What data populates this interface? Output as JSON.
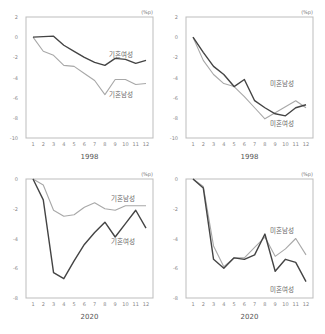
{
  "chart_data": [
    {
      "type": "line",
      "title": "",
      "xlabel": "1998",
      "ylabel": "",
      "unit": "(%p)",
      "categories": [
        "1",
        "2",
        "3",
        "4",
        "5",
        "6",
        "7",
        "8",
        "9",
        "10",
        "11",
        "12"
      ],
      "yticks": [
        2,
        0,
        -2,
        -4,
        -6,
        -8,
        -10
      ],
      "ylim": [
        -10,
        2
      ],
      "series": [
        {
          "name": "기혼여성",
          "color": "#444444",
          "values": [
            0,
            0.05,
            0.1,
            -0.8,
            -1.4,
            -2.0,
            -2.5,
            -2.8,
            -2.1,
            -2.2,
            -2.6,
            -2.3
          ]
        },
        {
          "name": "기혼남성",
          "color": "#a8a8a8",
          "values": [
            0,
            -1.4,
            -1.8,
            -2.8,
            -2.9,
            -3.6,
            -4.3,
            -5.7,
            -4.2,
            -4.2,
            -4.7,
            -4.6
          ]
        }
      ]
    },
    {
      "type": "line",
      "title": "",
      "xlabel": "1998",
      "ylabel": "",
      "unit": "(%p)",
      "categories": [
        "1",
        "2",
        "3",
        "4",
        "5",
        "6",
        "7",
        "8",
        "9",
        "10",
        "11",
        "12"
      ],
      "yticks": [
        2,
        0,
        -2,
        -4,
        -6,
        -8,
        -10
      ],
      "ylim": [
        -10,
        2
      ],
      "series": [
        {
          "name": "미혼남성",
          "color": "#444444",
          "values": [
            0,
            -1.5,
            -2.9,
            -3.7,
            -4.9,
            -4.2,
            -6.3,
            -7.0,
            -7.6,
            -7.8,
            -7.0,
            -6.7
          ]
        },
        {
          "name": "미혼여성",
          "color": "#a8a8a8",
          "values": [
            0,
            -2.3,
            -3.7,
            -4.6,
            -4.9,
            -5.9,
            -7.0,
            -8.1,
            -7.5,
            -6.9,
            -6.3,
            -7.0
          ]
        }
      ]
    },
    {
      "type": "line",
      "title": "",
      "xlabel": "2020",
      "ylabel": "",
      "unit": "(%p)",
      "categories": [
        "1",
        "2",
        "3",
        "4",
        "5",
        "6",
        "7",
        "8",
        "9",
        "10",
        "11",
        "12"
      ],
      "yticks": [
        0,
        -2,
        -4,
        -6,
        -8
      ],
      "ylim": [
        -8,
        0
      ],
      "series": [
        {
          "name": "기혼남성",
          "color": "#a8a8a8",
          "values": [
            0,
            -0.4,
            -2.1,
            -2.5,
            -2.4,
            -1.9,
            -1.6,
            -2.0,
            -2.1,
            -1.8,
            -1.8,
            -1.8
          ]
        },
        {
          "name": "기혼여성",
          "color": "#444444",
          "values": [
            0,
            -1.4,
            -6.3,
            -6.7,
            -5.5,
            -4.4,
            -3.6,
            -2.9,
            -3.9,
            -3.0,
            -2.1,
            -3.3
          ]
        }
      ]
    },
    {
      "type": "line",
      "title": "",
      "xlabel": "2020",
      "ylabel": "",
      "unit": "(%p)",
      "categories": [
        "1",
        "2",
        "3",
        "4",
        "5",
        "6",
        "7",
        "8",
        "9",
        "10",
        "11",
        "12"
      ],
      "yticks": [
        0,
        -2,
        -4,
        -6,
        -8
      ],
      "ylim": [
        -8,
        0
      ],
      "series": [
        {
          "name": "미혼남성",
          "color": "#a8a8a8",
          "values": [
            0,
            -0.5,
            -4.5,
            -5.9,
            -5.3,
            -5.3,
            -4.6,
            -3.9,
            -5.2,
            -4.7,
            -4.0,
            -5.1
          ]
        },
        {
          "name": "미혼여성",
          "color": "#444444",
          "values": [
            0,
            -0.6,
            -5.4,
            -6.0,
            -5.3,
            -5.4,
            -5.1,
            -3.7,
            -6.2,
            -5.4,
            -5.6,
            -6.9
          ]
        }
      ]
    }
  ],
  "panels": [
    {
      "unit": "(%p)",
      "xlabel": "1998",
      "label_dark": "기혼여성",
      "label_light": "기혼남성"
    },
    {
      "unit": "(%p)",
      "xlabel": "1998",
      "label_dark": "미혼남성",
      "label_light": "미혼여성"
    },
    {
      "unit": "(%p)",
      "xlabel": "2020",
      "label_dark": "기혼여성",
      "label_light": "기혼남성"
    },
    {
      "unit": "(%p)",
      "xlabel": "2020",
      "label_dark": "미혼여성",
      "label_light": "미혼남성"
    }
  ]
}
